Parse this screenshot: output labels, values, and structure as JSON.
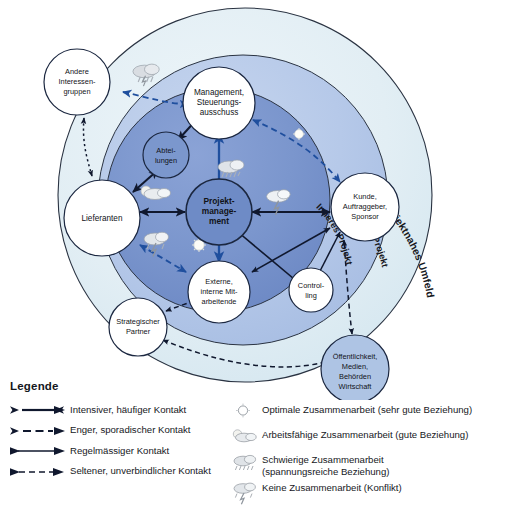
{
  "diagram": {
    "rings": [
      {
        "id": "projektnahes-umfeld",
        "label": "Projektnahes Umfeld",
        "color": "#e2eef4"
      },
      {
        "id": "aeusseres-projekt",
        "label": "Äusseres Projekt",
        "color": "#b9cbe8"
      },
      {
        "id": "inneres-projekt",
        "label": "Inneres Projekt",
        "color": "#7e99d0"
      }
    ],
    "nodes": [
      {
        "id": "projektmanagement",
        "lines": [
          "Projekt-",
          "manage-",
          "ment"
        ],
        "fill": "#6e8bc6",
        "bold": true
      },
      {
        "id": "management-steuerungsausschuss",
        "lines": [
          "Management,",
          "Steuerungs-",
          "ausschuss"
        ],
        "fill": "#ffffff",
        "bold": false
      },
      {
        "id": "abteilungen",
        "lines": [
          "Abtei-",
          "lungen"
        ],
        "fill": "#7b97cd",
        "bold": false
      },
      {
        "id": "externe-interne-mitarbeitende",
        "lines": [
          "Externe,",
          "interne Mit-",
          "arbeitende"
        ],
        "fill": "#ffffff",
        "bold": false
      },
      {
        "id": "lieferanten",
        "lines": [
          "Lieferanten"
        ],
        "fill": "#ffffff",
        "bold": false
      },
      {
        "id": "kunde-auftraggeber-sponsor",
        "lines": [
          "Kunde,",
          "Auftraggeber,",
          "Sponsor"
        ],
        "fill": "#ffffff",
        "bold": false
      },
      {
        "id": "controlling",
        "lines": [
          "Control-",
          "ling"
        ],
        "fill": "#ffffff",
        "bold": false
      },
      {
        "id": "andere-interessengruppen",
        "lines": [
          "Andere",
          "Interessen-",
          "gruppen"
        ],
        "fill": "#ffffff",
        "bold": false
      },
      {
        "id": "strategischer-partner",
        "lines": [
          "Strategischer",
          "Partner"
        ],
        "fill": "#ffffff",
        "bold": false
      },
      {
        "id": "oeffentlichkeit-medien-behoerden-wirtschaft",
        "lines": [
          "Öffentlichkeit,",
          "Medien,",
          "Behörden",
          "Wirtschaft"
        ],
        "fill": "#aec4e4",
        "bold": false
      }
    ]
  },
  "legend": {
    "title": "Legende",
    "lines": [
      {
        "id": "intensiver-haeufiger-kontakt",
        "label": "Intensiver, häufiger Kontakt",
        "style": "solid-thick-both"
      },
      {
        "id": "enger-sporadischer-kontakt",
        "label": "Enger, sporadischer Kontakt",
        "style": "dashed-thick-both"
      },
      {
        "id": "regelmaessiger-kontakt",
        "label": "Regelmässiger Kontakt",
        "style": "solid-thin-both"
      },
      {
        "id": "seltener-unverbindlicher-kontakt",
        "label": "Seltener, unverbindlicher Kontakt",
        "style": "dashed-thin-both"
      }
    ],
    "weather": [
      {
        "id": "optimale-zusammenarbeit",
        "icon": "sun-icon",
        "label": "Optimale Zusammenarbeit (sehr gute Beziehung)"
      },
      {
        "id": "arbeitsfaehige-zusammenarbeit",
        "icon": "sun-behind-cloud-icon",
        "label": "Arbeitsfähige Zusammenarbeit (gute Beziehung)"
      },
      {
        "id": "schwierige-zusammenarbeit",
        "icon": "rain-cloud-icon",
        "label": "Schwierige Zusammenarbeit\n(spannungsreiche Beziehung)"
      },
      {
        "id": "keine-zusammenarbeit",
        "icon": "thunderstorm-icon",
        "label": "Keine Zusammenarbeit (Konflikt)"
      }
    ]
  }
}
